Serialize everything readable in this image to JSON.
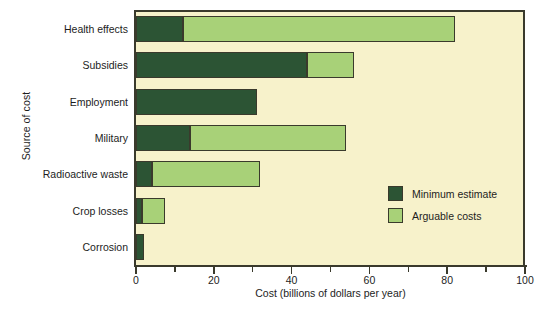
{
  "chart_data": {
    "type": "bar",
    "orientation": "horizontal",
    "stacked": true,
    "title": "",
    "xlabel": "Cost (billions of dollars per year)",
    "ylabel": "Source of cost",
    "xlim": [
      0,
      100
    ],
    "xticks": [
      0,
      20,
      40,
      60,
      80,
      100
    ],
    "xtick_labels": [
      "0",
      "20",
      "40",
      "60",
      "80",
      "100"
    ],
    "xminor_ticks": [
      10,
      30,
      50,
      70,
      90
    ],
    "grid": false,
    "legend_position": "inside-right",
    "categories": [
      "Health effects",
      "Subsidies",
      "Employment",
      "Military",
      "Radioactive waste",
      "Crop losses",
      "Corrosion"
    ],
    "series": [
      {
        "name": "Minimum estimate",
        "color": "#2c5434",
        "values": [
          12,
          44,
          31,
          14,
          4,
          1.5,
          2
        ]
      },
      {
        "name": "Arguable costs",
        "color": "#a8d178",
        "values": [
          70,
          12,
          0,
          40,
          28,
          6,
          0
        ]
      }
    ],
    "totals": [
      82,
      56,
      31,
      54,
      32,
      7.5,
      2
    ],
    "plot_background": "#f7f2cb",
    "axis_color": "#3a3a2c"
  },
  "legend": {
    "items": [
      {
        "label": "Minimum estimate"
      },
      {
        "label": "Arguable costs"
      }
    ]
  }
}
